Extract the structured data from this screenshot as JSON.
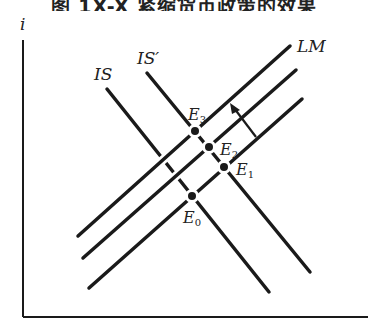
{
  "title": {
    "text": "图 1X-X  紧缩货币政策的效果",
    "visibility": "clipped at top edge, only lower part of glyphs visible"
  },
  "axes": {
    "y_label": "i",
    "x_label": ""
  },
  "curves": {
    "lm_label": "LM",
    "is_label": "IS",
    "is_prime_label": "IS′"
  },
  "points": [
    {
      "label": "E",
      "sub": "0"
    },
    {
      "label": "E",
      "sub": "1"
    },
    {
      "label": "E",
      "sub": "2"
    },
    {
      "label": "E",
      "sub": "3"
    }
  ],
  "arrow": {
    "direction": "up-left",
    "meaning": "LM shifts leftward"
  },
  "colors": {
    "line": "#1a1a1a",
    "background": "#ffffff"
  }
}
